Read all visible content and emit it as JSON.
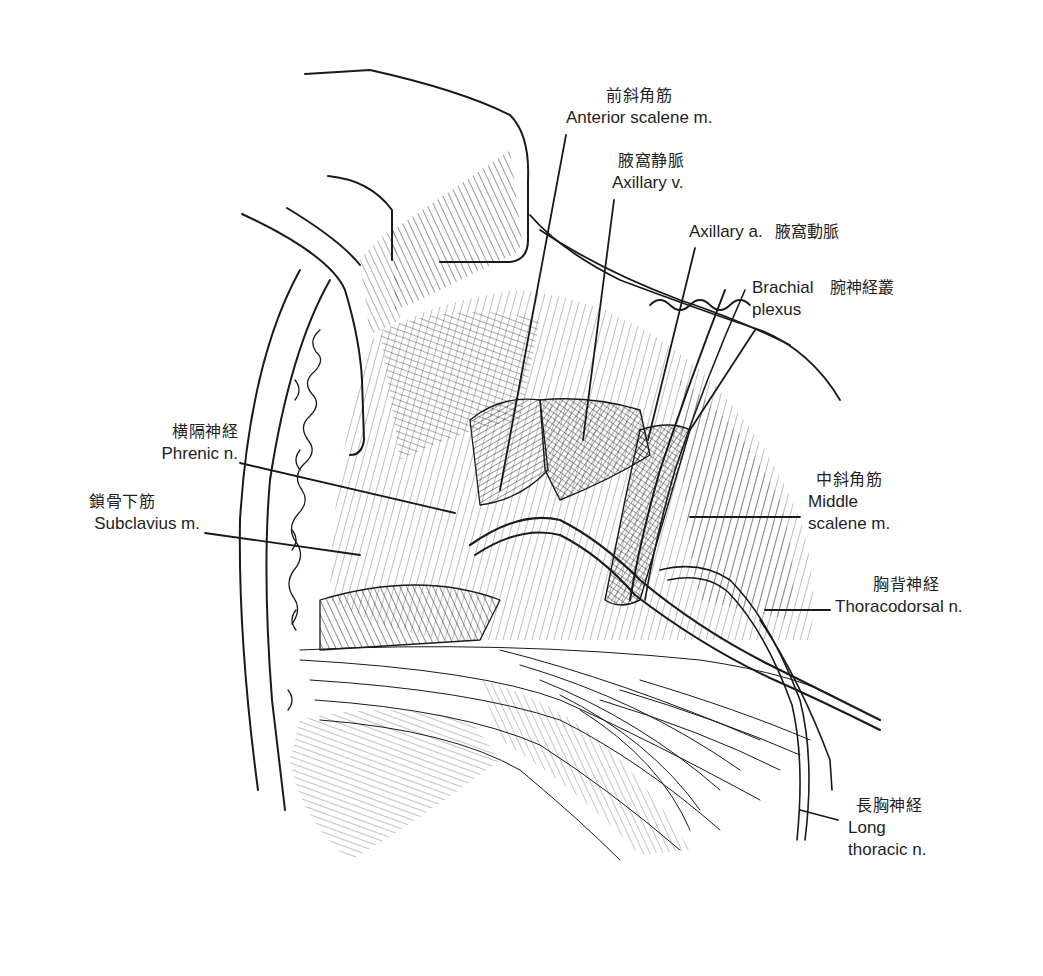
{
  "figure": {
    "type": "anatomical-illustration",
    "colors": {
      "ink": "#1a1a1a",
      "background": "#ffffff"
    }
  },
  "labels": {
    "anterior_scalene": {
      "jp": "前斜角筋",
      "en": "Anterior scalene m."
    },
    "axillary_vein": {
      "jp": "腋窩静脈",
      "en": "Axillary v."
    },
    "axillary_artery": {
      "en": "Axillary a.",
      "jp": "腋窩動脈"
    },
    "brachial_plexus": {
      "en_line1": "Brachial",
      "jp": "腕神経叢",
      "en_line2": "plexus"
    },
    "phrenic": {
      "jp": "横隔神経",
      "en": "Phrenic n."
    },
    "subclavius": {
      "jp": "鎖骨下筋",
      "en": "Subclavius m."
    },
    "middle_scalene": {
      "jp": "中斜角筋",
      "en_line1": "Middle",
      "en_line2": "scalene m."
    },
    "thoracodorsal": {
      "jp": "胸背神経",
      "en": "Thoracodorsal n."
    },
    "long_thoracic": {
      "jp": "長胸神経",
      "en_line1": "Long",
      "en_line2": "thoracic n."
    }
  }
}
